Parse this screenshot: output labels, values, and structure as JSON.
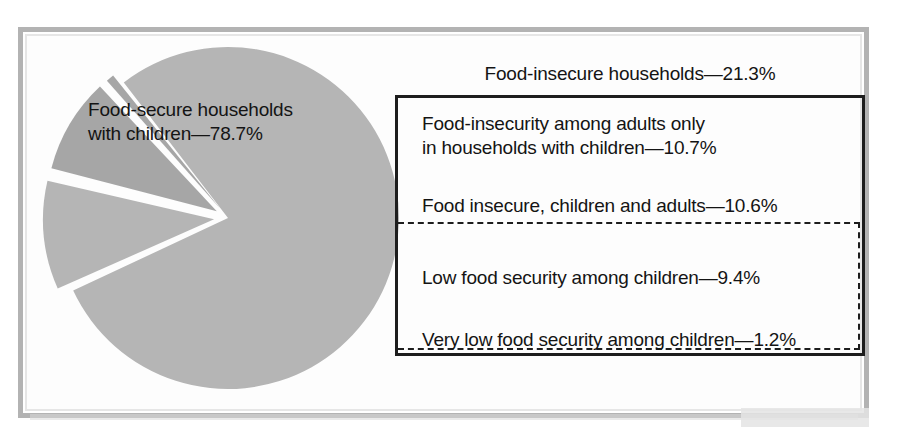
{
  "chart_data": {
    "type": "pie",
    "title": "",
    "categories": [
      "Food-secure households with children",
      "Food-insecurity among adults only in households with children",
      "Low food security among children",
      "Very low food security among children"
    ],
    "values": [
      78.7,
      10.7,
      9.4,
      1.2
    ],
    "units": "percent",
    "grid": false,
    "legend_position": "right-callout-boxes",
    "groupings": [
      {
        "label": "Food-insecure households",
        "value": 21.3,
        "members": [
          "Food-insecurity among adults only in households with children",
          "Low food security among children",
          "Very low food security among children"
        ]
      },
      {
        "label": "Food insecure, children and adults",
        "value": 10.6,
        "members": [
          "Low food security among children",
          "Very low food security among children"
        ]
      }
    ],
    "annotations": [
      "Food-secure households with children—78.7%",
      "Food-insecure households—21.3%",
      "Food-insecurity among adults only in households with children—10.7%",
      "Food insecure, children and adults—10.6%",
      "Low food security among children—9.4%",
      "Very low food security among children—1.2%"
    ],
    "slice_colors": [
      "#b5b5b5",
      "#b5b5b5",
      "#a6a6a6",
      "#a6a6a6"
    ]
  },
  "labels": {
    "food_secure": "Food-secure households\nwith children—78.7%",
    "food_insecure_total": "Food-insecure households—21.3%",
    "adults_only": "Food-insecurity among adults only\nin households with children—10.7%",
    "children_and_adults": "Food insecure, children and adults—10.6%",
    "low_food_security": "Low food security among children—9.4%",
    "very_low_food_security": "Very low food security among children—1.2%"
  },
  "colors": {
    "pie_light": "#b5b5b5",
    "pie_dark": "#a6a6a6",
    "text": "#141414",
    "box_border": "#1d1d1d",
    "page_frame": "#b3b3b3",
    "background": "#ffffff"
  }
}
